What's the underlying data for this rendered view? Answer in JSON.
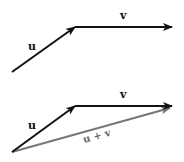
{
  "diagram_top": {
    "vectors": [
      {
        "name": "u",
        "label": "u",
        "from": [
          12,
          72
        ],
        "to": [
          75,
          27
        ],
        "color": "#111111"
      },
      {
        "name": "v",
        "label": "v",
        "from": [
          75,
          27
        ],
        "to": [
          172,
          27
        ],
        "color": "#111111"
      }
    ]
  },
  "diagram_bottom": {
    "vectors": [
      {
        "name": "u",
        "label": "u",
        "from": [
          12,
          152
        ],
        "to": [
          75,
          106
        ],
        "color": "#111111"
      },
      {
        "name": "v",
        "label": "v",
        "from": [
          75,
          106
        ],
        "to": [
          172,
          106
        ],
        "color": "#111111"
      },
      {
        "name": "u-plus-v",
        "label": "u + v",
        "from": [
          12,
          152
        ],
        "to": [
          170,
          108
        ],
        "color": "#777777"
      }
    ]
  }
}
